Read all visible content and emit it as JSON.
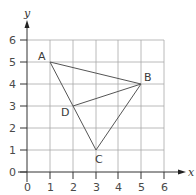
{
  "diagram": {
    "title": "",
    "axes": {
      "x": {
        "label": "x",
        "ticks": [
          "0",
          "1",
          "2",
          "3",
          "4",
          "5",
          "6"
        ],
        "min": 0,
        "max": 6
      },
      "y": {
        "label": "y",
        "ticks": [
          "0",
          "1",
          "2",
          "3",
          "4",
          "5",
          "6"
        ],
        "min": 0,
        "max": 6
      }
    },
    "points": [
      {
        "name": "A",
        "x": 1,
        "y": 5
      },
      {
        "name": "B",
        "x": 5,
        "y": 4
      },
      {
        "name": "C",
        "x": 3,
        "y": 1
      },
      {
        "name": "D",
        "x": 2,
        "y": 3
      }
    ],
    "segments": [
      [
        "A",
        "B"
      ],
      [
        "A",
        "C"
      ],
      [
        "B",
        "C"
      ],
      [
        "B",
        "D"
      ]
    ],
    "colors": {
      "grid": "#9a9a9a",
      "lines": "#555555",
      "axis": "#333333"
    }
  }
}
